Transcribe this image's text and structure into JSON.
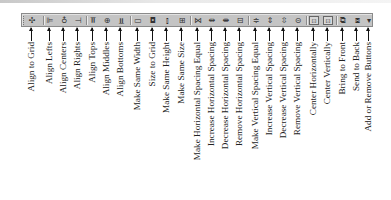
{
  "toolbar": {
    "name": "Layout toolbar",
    "background": "#c4c4c4",
    "border": "#8a8a8a",
    "buttons": [
      {
        "id": "align-to-grid",
        "label": "Align to Grid",
        "glyph": "✣",
        "x": 31
      },
      {
        "id": "align-lefts",
        "label": "Align Lefts",
        "glyph": "⊫",
        "x": 49
      },
      {
        "id": "align-centers",
        "label": "Align Centers",
        "glyph": "♁",
        "x": 63
      },
      {
        "id": "align-rights",
        "label": "Align Rights",
        "glyph": "⊣",
        "x": 77
      },
      {
        "id": "align-tops",
        "label": "Align Tops",
        "glyph": "⫪",
        "x": 92
      },
      {
        "id": "align-middles",
        "label": "Align Middles",
        "glyph": "⊕",
        "x": 106
      },
      {
        "id": "align-bottoms",
        "label": "Align Bottoms",
        "glyph": "⫫",
        "x": 120
      },
      {
        "id": "make-same-width",
        "label": "Make Same Width",
        "glyph": "▭",
        "x": 137
      },
      {
        "id": "size-to-grid",
        "label": "Size to Grid",
        "glyph": "◘",
        "x": 152
      },
      {
        "id": "make-same-height",
        "label": "Make Same Height",
        "glyph": "⫾",
        "x": 166
      },
      {
        "id": "make-same-size",
        "label": "Make Same Size",
        "glyph": "⊞",
        "x": 181
      },
      {
        "id": "make-horizontal-spacing-equal",
        "label": "Make Horizontal Spacing Equal",
        "glyph": "⋈",
        "x": 197
      },
      {
        "id": "increase-horizontal-spacing",
        "label": "Increase Horizontal Spacing",
        "glyph": "⇹",
        "x": 211
      },
      {
        "id": "decrease-horizontal-spacing",
        "label": "Decrease Horizontal Spacing",
        "glyph": "⇼",
        "x": 225
      },
      {
        "id": "remove-horizontal-spacing",
        "label": "Remove Horizontal Spacing",
        "glyph": "⊟",
        "x": 239
      },
      {
        "id": "make-vertical-spacing-equal",
        "label": "Make Vertical Spacing Equal",
        "glyph": "≑",
        "x": 255
      },
      {
        "id": "increase-vertical-spacing",
        "label": "Increase Vertical Spacing",
        "glyph": "⇕",
        "x": 269
      },
      {
        "id": "decrease-vertical-spacing",
        "label": "Decrease Vertical Spacing",
        "glyph": "⇳",
        "x": 283
      },
      {
        "id": "remove-vertical-spacing",
        "label": "Remove Vertical Spacing",
        "glyph": "⊝",
        "x": 297
      },
      {
        "id": "center-horizontally",
        "label": "Center Horizontally",
        "glyph": "⊡",
        "x": 313
      },
      {
        "id": "center-vertically",
        "label": "Center Vertically",
        "glyph": "⊡",
        "x": 327
      },
      {
        "id": "bring-to-front",
        "label": "Bring to Front",
        "glyph": "⧉",
        "x": 342
      },
      {
        "id": "send-to-back",
        "label": "Send to Back",
        "glyph": "⧈",
        "x": 356
      },
      {
        "id": "add-or-remove-buttons",
        "label": "Add or Remove Buttons",
        "glyph": "▾",
        "x": 368
      }
    ],
    "separators_x": [
      42,
      85,
      129,
      189,
      247,
      305,
      335
    ]
  }
}
